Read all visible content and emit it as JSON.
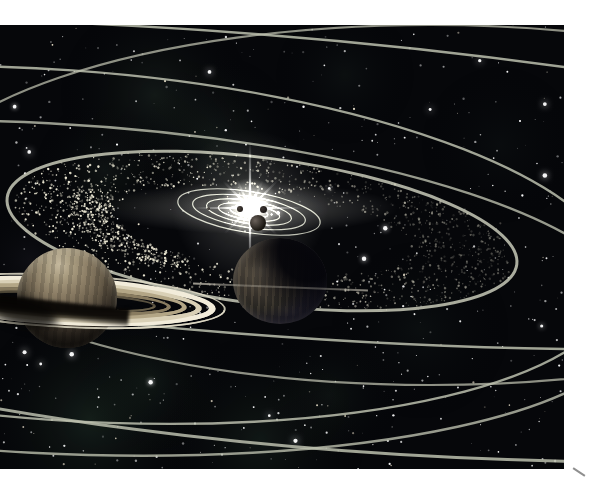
{
  "scene": {
    "width": 594,
    "height": 489,
    "frame_color": "#ffffff",
    "photo": {
      "x": 0,
      "y": 25,
      "w": 564,
      "h": 444,
      "bg": "#06070a"
    },
    "corner_mark": {
      "x": 572,
      "y": 471,
      "w": 14,
      "h": 2,
      "rot": 33,
      "color": "#8f8f8f"
    }
  },
  "starfield": {
    "seed": 42,
    "count": 560,
    "bright_count": 20,
    "star_color": "#ffffff",
    "warm_color": "#f2e8d2"
  },
  "nebula_patches": [
    {
      "x": 155,
      "y": 95,
      "r": 95,
      "color": "rgba(72,98,78,0.20)"
    },
    {
      "x": 105,
      "y": 170,
      "r": 70,
      "color": "rgba(62,88,72,0.16)"
    },
    {
      "x": 215,
      "y": 140,
      "r": 85,
      "color": "rgba(76,102,82,0.18)"
    },
    {
      "x": 345,
      "y": 75,
      "r": 70,
      "color": "rgba(60,82,70,0.11)"
    },
    {
      "x": 90,
      "y": 420,
      "r": 115,
      "color": "rgba(72,112,82,0.22)"
    },
    {
      "x": 150,
      "y": 380,
      "r": 80,
      "color": "rgba(62,96,72,0.16)"
    },
    {
      "x": 260,
      "y": 440,
      "r": 105,
      "color": "rgba(66,102,76,0.18)"
    },
    {
      "x": 330,
      "y": 395,
      "r": 70,
      "color": "rgba(62,96,72,0.12)"
    },
    {
      "x": 420,
      "y": 330,
      "r": 90,
      "color": "rgba(56,82,66,0.10)"
    },
    {
      "x": 500,
      "y": 145,
      "r": 80,
      "color": "rgba(52,72,62,0.08)"
    },
    {
      "x": 30,
      "y": 260,
      "r": 60,
      "color": "rgba(82,76,96,0.10)"
    }
  ],
  "orbit_rings": {
    "color": "rgba(188,191,174,1)",
    "rings": [
      {
        "cx": 430,
        "cy": 205,
        "a": 525,
        "b": 180,
        "rot": 0,
        "w": 2.2,
        "alpha": 0.75
      },
      {
        "cx": 60,
        "cy": 245,
        "a": 560,
        "b": 175,
        "rot": 4,
        "w": 2.4,
        "alpha": 0.85
      },
      {
        "cx": 40,
        "cy": 288,
        "a": 600,
        "b": 165,
        "rot": 3,
        "w": 2.4,
        "alpha": 0.8
      },
      {
        "cx": 250,
        "cy": 184,
        "a": 900,
        "b": 150,
        "rot": 4.5,
        "w": 2.4,
        "alpha": 0.85
      },
      {
        "cx": 262,
        "cy": 231,
        "a": 257,
        "b": 73,
        "rot": 7.5,
        "w": 3,
        "alpha": 0.9
      },
      {
        "cx": 650,
        "cy": -3,
        "a": 1400,
        "b": 465,
        "rot": 0,
        "w": 3,
        "alpha": 0.85
      }
    ]
  },
  "inner_orbits": {
    "cx": 249,
    "cy": 212,
    "rot": 9,
    "color": "rgba(216,219,202,0.8)",
    "w": 1.2,
    "sizes": [
      [
        19,
        5
      ],
      [
        31,
        8
      ],
      [
        43,
        11.5
      ],
      [
        57,
        15.5
      ],
      [
        72,
        20.5
      ]
    ]
  },
  "asteroid_belt": {
    "cx": 262,
    "cy": 231,
    "rot": 7.5,
    "a_inner": 150,
    "b_inner": 40,
    "a_outer": 250,
    "b_outer": 72,
    "count": 1500,
    "cluster_count": 380,
    "dot_color": "232,228,208"
  },
  "sun": {
    "x": 250,
    "y": 208,
    "core_color": "#ffffff",
    "glow_color": "255,253,244",
    "halo_r": 78,
    "mid_r": 30,
    "core_r": 9,
    "streak_w": 150,
    "streak_h": 26,
    "rays": [
      {
        "ang": 90,
        "len": 66,
        "al": 0.9
      },
      {
        "ang": 270,
        "len": 60,
        "al": 0.85
      },
      {
        "ang": 0,
        "len": 52,
        "al": 0.6
      },
      {
        "ang": 180,
        "len": 55,
        "al": 0.6
      },
      {
        "ang": 45,
        "len": 40,
        "al": 0.5
      },
      {
        "ang": 135,
        "len": 38,
        "al": 0.5
      },
      {
        "ang": 225,
        "len": 36,
        "al": 0.45
      },
      {
        "ang": 315,
        "len": 38,
        "al": 0.5
      },
      {
        "ang": 65,
        "len": 30,
        "al": 0.4
      },
      {
        "ang": 115,
        "len": 32,
        "al": 0.4
      },
      {
        "ang": 245,
        "len": 28,
        "al": 0.35
      },
      {
        "ang": 295,
        "len": 30,
        "al": 0.35
      },
      {
        "ang": 20,
        "len": 26,
        "al": 0.35
      },
      {
        "ang": 160,
        "len": 26,
        "al": 0.35
      }
    ]
  },
  "inner_planets": [
    {
      "x": 208,
      "y": 208,
      "r": 1.5,
      "c1": "#5a5550",
      "c2": "#33302c"
    },
    {
      "x": 239.5,
      "y": 208.5,
      "r": 3,
      "c1": "#4a423c",
      "c2": "#26211e"
    },
    {
      "x": 263,
      "y": 209.5,
      "r": 3.5,
      "c1": "#3c3531",
      "c2": "#1e1a18"
    },
    {
      "x": 257.5,
      "y": 222.5,
      "r": 8,
      "c1": "#6a615a",
      "c2": "#17140f"
    }
  ],
  "gas_giant": {
    "cx": 280,
    "cy": 281,
    "rx": 47,
    "ry": 43,
    "base": [
      "#5a5348",
      "#474138",
      "#36312b",
      "#272521",
      "#1a1922",
      "#11111b",
      "#0b0b12"
    ],
    "stripe_color": "rgba(142,126,100,0.22)",
    "shade_color": "rgba(4,4,9,0.93)",
    "rim": "rgba(205,195,175,0.28)",
    "face_line": {
      "x1": 193,
      "x2": 368,
      "y": 287,
      "rot": 2.3,
      "color": "210,205,190"
    }
  },
  "saturn_planet": {
    "cx": 67,
    "cy": 298,
    "r": 50,
    "body": [
      "#c6ba9f",
      "#a89b7f",
      "#8b7d65",
      "#6c604d",
      "#4d4337",
      "#342d25",
      "#251f1a"
    ],
    "shadow_band": {
      "cx": 62,
      "cy": 310,
      "w": 134,
      "h": 17,
      "rot": 6,
      "color": "rgba(8,6,4,0.95)"
    },
    "cast_shadow": {
      "cx": 22,
      "cy": 312,
      "w": 74,
      "h": 28,
      "rot": 14,
      "color": "rgba(5,4,3,0.8)"
    },
    "ring": {
      "cx": 66,
      "cy": 301,
      "rot": 3,
      "clip_front_pct": 51.5,
      "bands": [
        {
          "w": 320,
          "h": 54,
          "bw": 2,
          "color": "rgba(225,220,200,0.85)"
        },
        {
          "w": 300,
          "h": 48,
          "bw": 7,
          "color": "#f2ecda"
        },
        {
          "w": 272,
          "h": 41,
          "bw": 6,
          "color": "#d9d0b6"
        },
        {
          "w": 242,
          "h": 34,
          "bw": 5,
          "color": "#b3a686"
        },
        {
          "w": 210,
          "h": 27,
          "bw": 4,
          "color": "#897c60"
        },
        {
          "w": 180,
          "h": 21,
          "bw": 3,
          "color": "rgba(110,100,78,0.8)"
        }
      ]
    }
  }
}
